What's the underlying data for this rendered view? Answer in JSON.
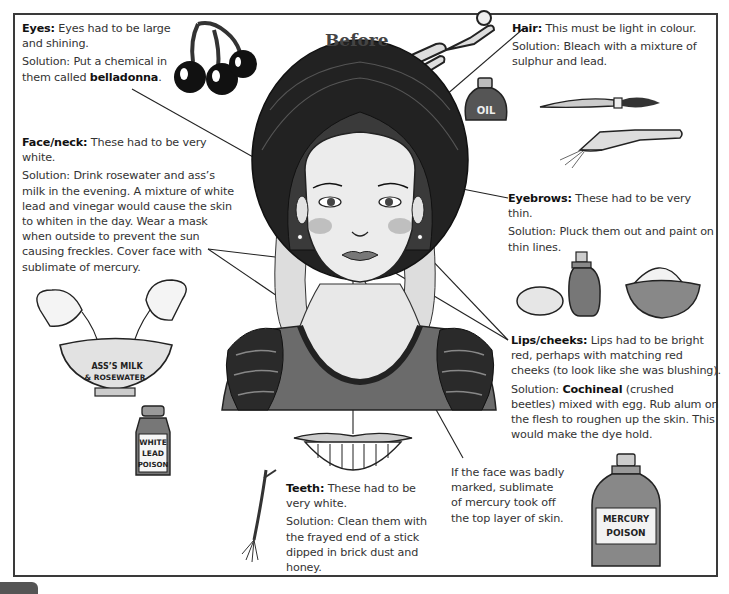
{
  "title": "Before",
  "annotations": {
    "eyes": {
      "heading": "Eyes:",
      "description": "Eyes had to be large and shining.",
      "solution_prefix": "Solution: Put a chemical in them called ",
      "solution_bold": "belladonna",
      "solution_suffix": "."
    },
    "face_neck": {
      "heading": "Face/neck:",
      "description": "These had to be very white.",
      "solution": "Solution: Drink rosewater and ass’s milk in the evening. A mixture of white lead and vinegar would cause the skin to whiten in the day. Wear a mask when outside to prevent the sun causing freckles. Cover face with sublimate of mercury."
    },
    "hair": {
      "heading": "Hair:",
      "description": "This must be light in colour.",
      "solution": "Solution: Bleach with a mixture of sulphur and lead."
    },
    "eyebrows": {
      "heading": "Eyebrows:",
      "description": "These had to be very thin.",
      "solution": "Solution: Pluck them out and paint on thin lines."
    },
    "lips_cheeks": {
      "heading": "Lips/cheeks:",
      "description": "Lips had to be bright red, perhaps with matching red cheeks (to look like she was blushing).",
      "solution_prefix": "Solution: ",
      "solution_bold": "Cochineal",
      "solution_suffix": " (crushed beetles) mixed with egg. Rub alum on the flesh to roughen up the skin. This would make the dye hold."
    },
    "teeth": {
      "heading": "Teeth:",
      "description": "These had to be very white.",
      "solution": "Solution: Clean them with the frayed end of a stick dipped in brick dust and honey."
    },
    "mercury_note": "If the face was badly marked, sublimate of mercury took off the top layer of skin."
  },
  "illustrations": {
    "oil_label": "OIL",
    "bowl_label_1": "ASS’S MILK",
    "bowl_label_2": "& ROSEWATER",
    "white_lead_label_1": "WHITE",
    "white_lead_label_2": "LEAD",
    "white_lead_label_3": "POISON",
    "mercury_label_1": "MERCURY",
    "mercury_label_2": "POISON"
  }
}
